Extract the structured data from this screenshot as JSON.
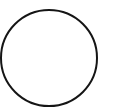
{
  "shape": {
    "type": "circle",
    "cx": 49,
    "cy": 58,
    "r": 48,
    "stroke": "#151515",
    "stroke_width": 2,
    "fill": "#ffffff"
  },
  "background": "#ffffff"
}
